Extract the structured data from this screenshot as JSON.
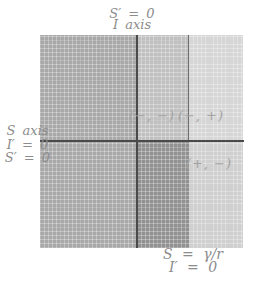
{
  "colors": {
    "background": "#ffffff",
    "left_column": "#a8a8a8",
    "top_middle": "#c0c0c0",
    "top_right": "#d6d6d6",
    "bottom_middle": "#919191",
    "bottom_right": "#cfcfcf",
    "axis_line": "#4a4a4a",
    "divider_line": "#6e6e6e",
    "label_text": "#8c8c8c",
    "region_text": "#a2a2a2"
  },
  "labels": {
    "top": {
      "line1": "S′ = 0",
      "line2": "I axis"
    },
    "left": {
      "line1": "S axis",
      "line2": "I′ = 0",
      "line3": "S′ = 0"
    },
    "bottom": {
      "line1": "S = γ/r",
      "line2": "I′ = 0"
    }
  },
  "regions": {
    "top_left": {
      "sign_label": ""
    },
    "top_middle": {
      "sign_label": "(−, −)"
    },
    "top_right": {
      "sign_label": "(−, +)"
    },
    "bottom_left": {
      "sign_label": ""
    },
    "bottom_middle": {
      "sign_label": ""
    },
    "bottom_right": {
      "sign_label": "(+, −)"
    }
  }
}
